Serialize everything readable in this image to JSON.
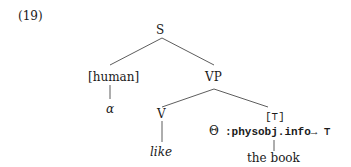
{
  "example_number": "(19)",
  "tree": {
    "root": "S",
    "subject": "[human]",
    "subject_child": "α",
    "vp": "VP",
    "verb": "V",
    "verb_word": "like",
    "object_type": "[⊤]",
    "object_theta": "Θ",
    "object_coercion": ":physobj.info→ ⊤",
    "object_word": "the book"
  }
}
